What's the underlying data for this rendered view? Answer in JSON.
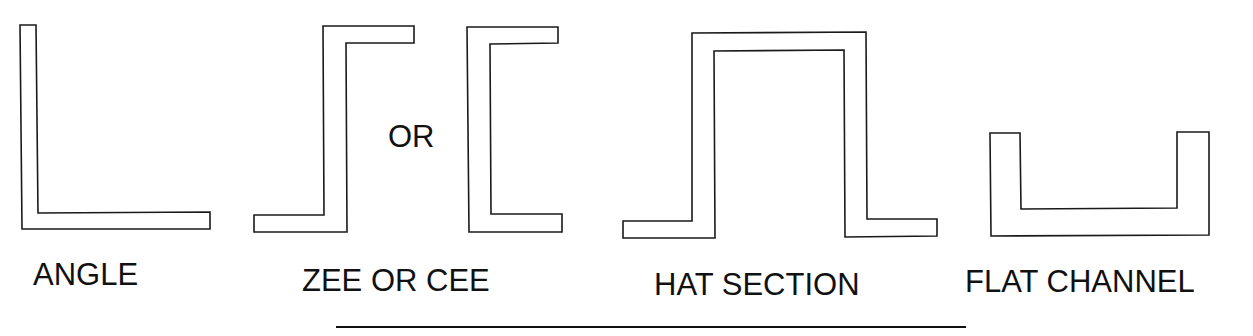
{
  "figure": {
    "shapes": [
      {
        "id": "angle",
        "label": "ANGLE"
      },
      {
        "id": "zee",
        "label": ""
      },
      {
        "id": "cee",
        "label": ""
      },
      {
        "id": "hat",
        "label": "HAT SECTION"
      },
      {
        "id": "flat-channel",
        "label": "FLAT CHANNEL"
      }
    ],
    "connector_text": "OR",
    "group_labels": {
      "angle": "ANGLE",
      "zee_or_cee": "ZEE OR CEE",
      "hat": "HAT SECTION",
      "flat_channel": "FLAT CHANNEL"
    },
    "colors": {
      "stroke": "#1a1a1a",
      "fill": "#ffffff",
      "text": "#111111"
    }
  }
}
